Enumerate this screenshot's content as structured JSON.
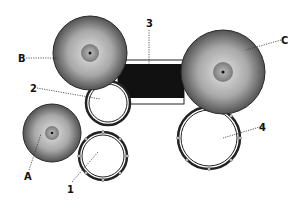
{
  "diagram": {
    "labels": {
      "A": "A",
      "B": "B",
      "C": "C",
      "d1": "1",
      "d2": "2",
      "d3": "3",
      "d4": "4"
    },
    "cymbals": [
      {
        "id": "A",
        "cx": 52,
        "cy": 133,
        "r": 29
      },
      {
        "id": "B",
        "cx": 90,
        "cy": 53,
        "r": 37
      },
      {
        "id": "C",
        "cx": 223,
        "cy": 72,
        "r": 42
      }
    ],
    "drums": [
      {
        "id": "1",
        "cx": 103,
        "cy": 156,
        "r": 24
      },
      {
        "id": "2",
        "cx": 108,
        "cy": 103,
        "r": 22
      },
      {
        "id": "4",
        "cx": 209,
        "cy": 138,
        "r": 31
      }
    ],
    "bass_drum": {
      "id": "3",
      "x": 118,
      "y": 60,
      "width": 66,
      "height": 44
    },
    "colors": {
      "cymbal_dark": "#3a3a3a",
      "cymbal_light": "#d8d8d8",
      "drum_outline": "#222222",
      "bass_fill": "#111111"
    }
  }
}
